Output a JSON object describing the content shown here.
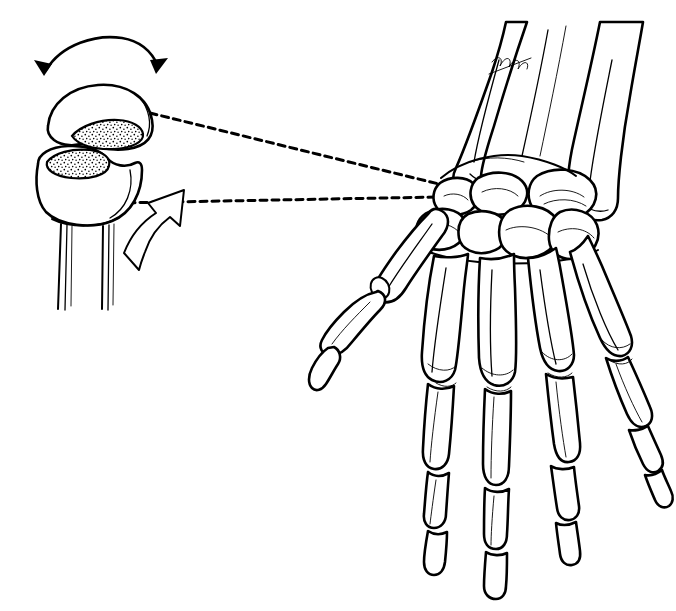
{
  "figure": {
    "title": "Trapeziometacarpal (thumb carpometacarpal) saddle joint detail with right hand skeleton",
    "style": "pen-and-ink line drawing",
    "background_color": "#ffffff",
    "ink_color": "#000000",
    "leader_color": "#a8a8a8",
    "width": 676,
    "height": 611,
    "signature": "artist-monogram"
  },
  "inset": {
    "name": "saddle-joint-detail",
    "upper_bone": {
      "name": "metacarpal-base-convex",
      "facet": "stippled-articular-surface",
      "facet_texture": "stipple"
    },
    "lower_bone": {
      "name": "trapezium-concave-saddle",
      "facet": "stippled-articular-surface",
      "facet_texture": "stipple",
      "shaft": "two-parallel-shaft-lines"
    },
    "motion_arrow_top": {
      "name": "double-headed-curved-arrow",
      "heads": 2,
      "style": "solid-filled",
      "meaning": "abduction-adduction-rotation"
    },
    "motion_arrow_lower": {
      "name": "curved-hollow-arrow",
      "heads": 1,
      "style": "outline-hollow",
      "meaning": "opposition-direction"
    }
  },
  "leaders": [
    {
      "name": "leader-line-upper",
      "from": "upper-bone-facet",
      "to": "wrist-trapezium-region",
      "style": "dashed"
    },
    {
      "name": "leader-line-lower",
      "from": "lower-bone-facet",
      "to": "wrist-trapezium-region",
      "style": "dashed"
    }
  ],
  "hand": {
    "name": "right-hand-skeleton-dorsal-view",
    "forearm": [
      {
        "name": "radius",
        "label": "radius"
      },
      {
        "name": "ulna",
        "label": "ulna"
      }
    ],
    "carpals": [
      {
        "name": "scaphoid"
      },
      {
        "name": "lunate"
      },
      {
        "name": "triquetrum"
      },
      {
        "name": "trapezium"
      },
      {
        "name": "trapezoid"
      },
      {
        "name": "capitate"
      },
      {
        "name": "hamate"
      }
    ],
    "digits": [
      {
        "name": "thumb",
        "metacarpal": "first-metacarpal",
        "phalanges": [
          "proximal-phalanx",
          "distal-phalanx"
        ],
        "sesamoid": true
      },
      {
        "name": "index-finger",
        "metacarpal": "second-metacarpal",
        "phalanges": [
          "proximal-phalanx",
          "middle-phalanx",
          "distal-phalanx"
        ]
      },
      {
        "name": "middle-finger",
        "metacarpal": "third-metacarpal",
        "phalanges": [
          "proximal-phalanx",
          "middle-phalanx",
          "distal-phalanx"
        ]
      },
      {
        "name": "ring-finger",
        "metacarpal": "fourth-metacarpal",
        "phalanges": [
          "proximal-phalanx",
          "middle-phalanx",
          "distal-phalanx"
        ]
      },
      {
        "name": "little-finger",
        "metacarpal": "fifth-metacarpal",
        "phalanges": [
          "proximal-phalanx",
          "middle-phalanx",
          "distal-phalanx"
        ]
      }
    ]
  }
}
